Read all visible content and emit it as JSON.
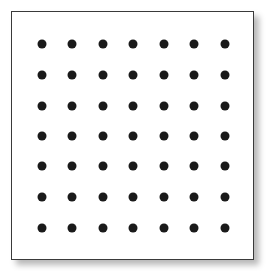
{
  "diagram": {
    "type": "dot-grid",
    "rows": 7,
    "columns": 7,
    "dot_color": "#1a1a1a",
    "border_color": "#3a3a3a",
    "background": "#ffffff",
    "column_centers_px": [
      42,
      72,
      103,
      133,
      164,
      194,
      225
    ],
    "row_centers_px": [
      44,
      75,
      106,
      136,
      166,
      197,
      228
    ]
  }
}
